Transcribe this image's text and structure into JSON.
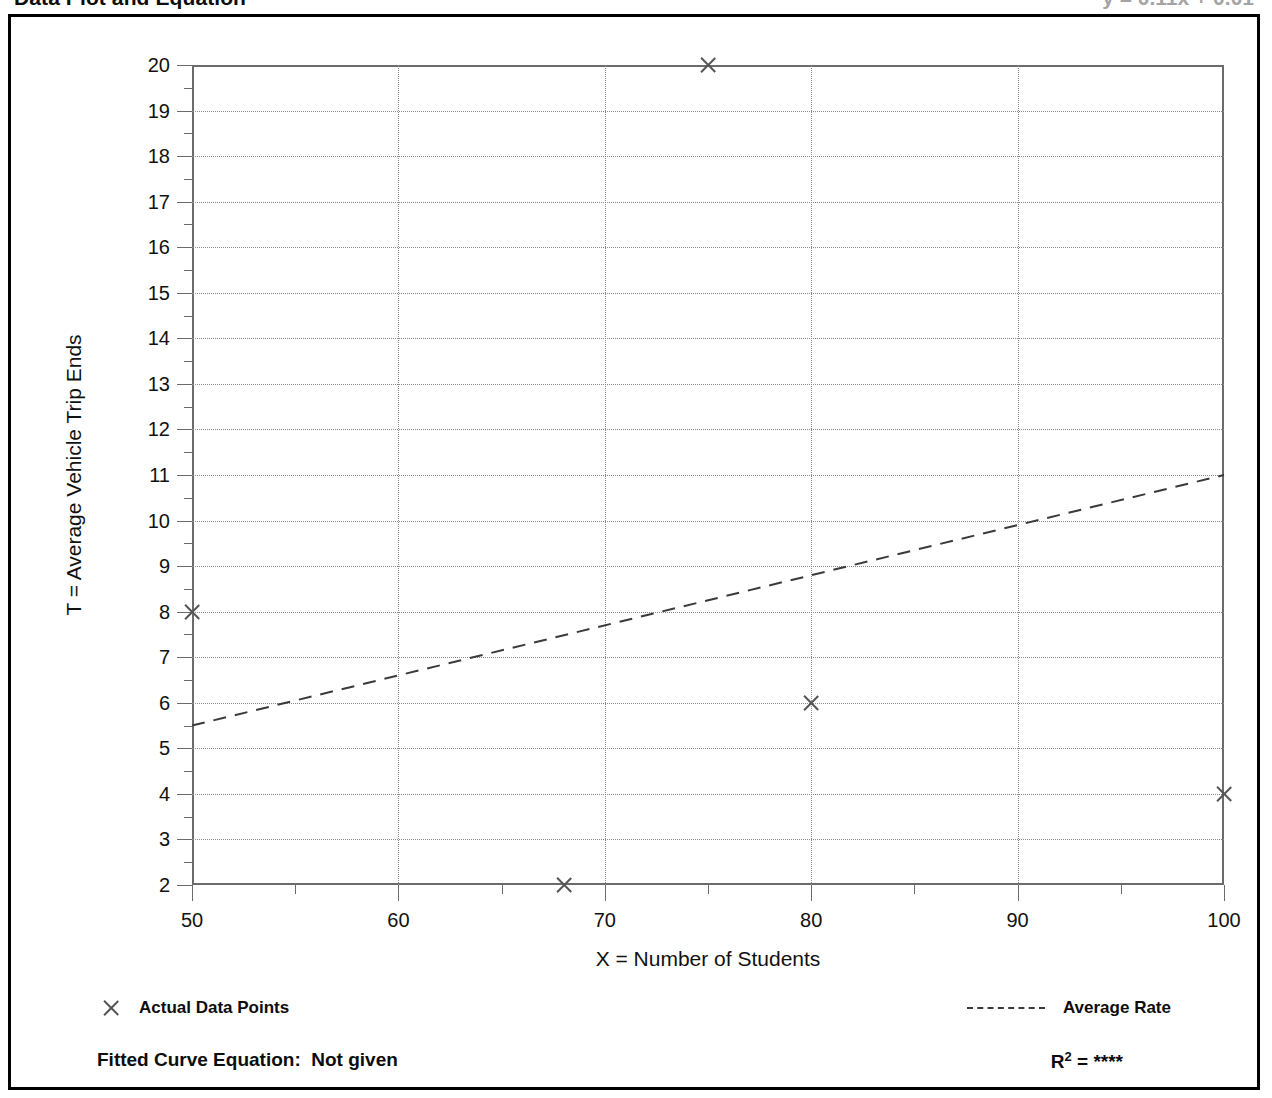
{
  "page_header": {
    "left_title": "Data Plot and Equation",
    "right_title": "y = 0.11x + 0.01"
  },
  "chart_data": {
    "type": "scatter",
    "title": "Data Plot and Equation",
    "xlabel": "X = Number of Students",
    "ylabel": "T = Average Vehicle Trip Ends",
    "xlim": [
      50,
      100
    ],
    "ylim": [
      2,
      20
    ],
    "xticks": [
      50,
      60,
      70,
      80,
      90,
      100
    ],
    "xtick_labels": [
      "50",
      "60",
      "70",
      "80",
      "90",
      "100"
    ],
    "x_minor_step": 5,
    "yticks": [
      2,
      3,
      4,
      5,
      6,
      7,
      8,
      9,
      10,
      11,
      12,
      13,
      14,
      15,
      16,
      17,
      18,
      19,
      20
    ],
    "ytick_labels": [
      "2",
      "3",
      "4",
      "5",
      "6",
      "7",
      "8",
      "9",
      "10",
      "11",
      "12",
      "13",
      "14",
      "15",
      "16",
      "17",
      "18",
      "19",
      "20"
    ],
    "y_minor_step": 0.5,
    "grid": true,
    "legend_position": "below-plot",
    "series": [
      {
        "name": "Actual Data Points",
        "type": "scatter",
        "marker": "x",
        "color": "#555555",
        "points": [
          {
            "x": 50,
            "y": 8
          },
          {
            "x": 68,
            "y": 2
          },
          {
            "x": 75,
            "y": 20
          },
          {
            "x": 80,
            "y": 6
          },
          {
            "x": 100,
            "y": 4
          }
        ]
      },
      {
        "name": "Average Rate",
        "type": "line",
        "linestyle": "dashed",
        "color": "#3a3a3a",
        "points": [
          {
            "x": 50,
            "y": 5.5
          },
          {
            "x": 100,
            "y": 11.0
          }
        ]
      }
    ],
    "annotations": {
      "fitted_curve_equation_label": "Fitted Curve Equation:",
      "fitted_curve_equation_value": "Not given",
      "r_squared_label": "R",
      "r_squared_exponent": "2",
      "r_squared_equals": " = ",
      "r_squared_value": "****"
    }
  },
  "legend": {
    "actual_label": "Actual Data Points",
    "rate_label": "Average Rate"
  },
  "footer": {
    "fitted_equation": "Fitted Curve Equation:  Not given",
    "r_label": "R",
    "r_exp": "2",
    "r_eq": " = ",
    "r_value": "****"
  }
}
